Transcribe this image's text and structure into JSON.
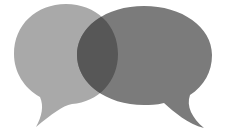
{
  "image": {
    "title": "Two overlapping speech bubbles",
    "description": "Illustration of two speech bubbles overlapping, forming a darker lens-shaped intersection",
    "background": "#ffffff"
  },
  "bubbles": [
    {
      "name": "left-bubble",
      "color": "#a9a9a9",
      "tail_direction": "down-left"
    },
    {
      "name": "right-bubble",
      "color": "#7b7b7b",
      "tail_direction": "down-right"
    }
  ],
  "overlap": {
    "color": "#575757"
  }
}
